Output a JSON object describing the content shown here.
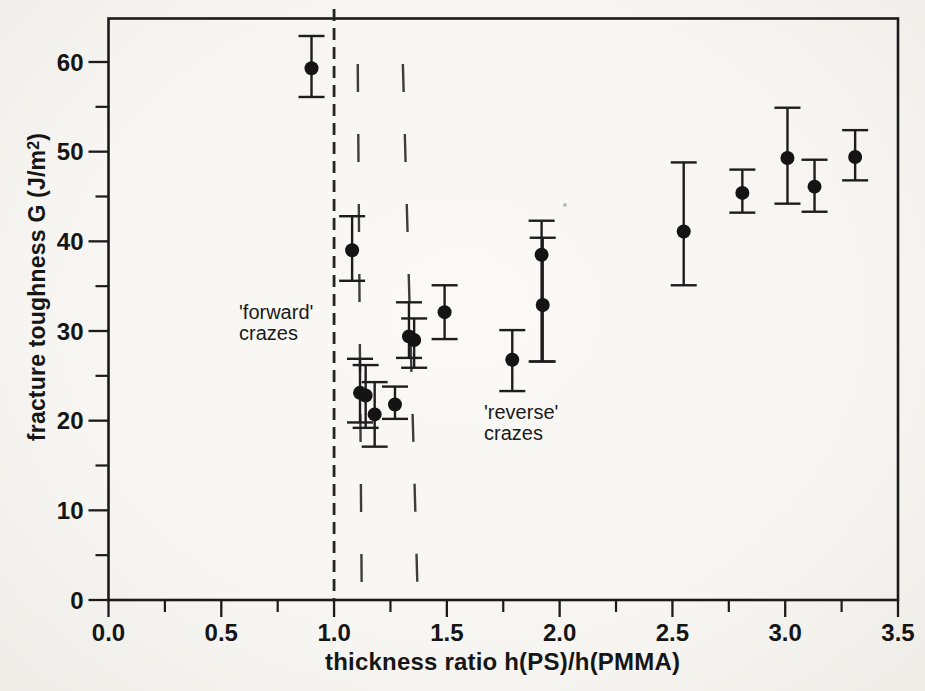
{
  "figure": {
    "background": "#f6f5f1",
    "ink": "#1b1b1b",
    "marker_color": "#141414"
  },
  "chart_data": {
    "type": "scatter",
    "title": "",
    "xlabel": "thickness ratio h(PS)/h(PMMA)",
    "ylabel": "fracture toughness G (J/m2)",
    "ylabel_parts": {
      "main": "fracture toughness G (J/m",
      "sup": "2",
      "close": ")"
    },
    "xlim": [
      0,
      3.5
    ],
    "ylim": [
      0,
      65
    ],
    "grid": false,
    "legend": "none",
    "marker": "filled-circle",
    "x_major_ticks": [
      0,
      0.5,
      1.0,
      1.5,
      2.0,
      2.5,
      3.0,
      3.5
    ],
    "x_tick_labels": [
      "0.0",
      "0.5",
      "1.0",
      "1.5",
      "2.0",
      "2.5",
      "3.0",
      "3.5"
    ],
    "x_minor_ticks": [
      0.25,
      0.75,
      1.25,
      1.75,
      2.25,
      2.75,
      3.25
    ],
    "y_major_ticks": [
      0,
      10,
      20,
      30,
      40,
      50,
      60
    ],
    "y_tick_labels": [
      "0",
      "10",
      "20",
      "30",
      "40",
      "50",
      "60"
    ],
    "y_minor_ticks": [
      5,
      15,
      25,
      35,
      45,
      55
    ],
    "points": [
      {
        "x": 0.9,
        "y": 59.3,
        "lo": 56.1,
        "hi": 62.9
      },
      {
        "x": 1.08,
        "y": 39.0,
        "lo": 35.6,
        "hi": 42.8
      },
      {
        "x": 1.115,
        "y": 23.1,
        "lo": 19.8,
        "hi": 26.9
      },
      {
        "x": 1.14,
        "y": 22.8,
        "lo": 19.2,
        "hi": 26.2
      },
      {
        "x": 1.18,
        "y": 20.7,
        "lo": 17.1,
        "hi": 24.3
      },
      {
        "x": 1.27,
        "y": 21.8,
        "lo": 20.2,
        "hi": 23.8
      },
      {
        "x": 1.332,
        "y": 29.4,
        "lo": 27.0,
        "hi": 33.2
      },
      {
        "x": 1.355,
        "y": 29.0,
        "lo": 25.9,
        "hi": 31.4
      },
      {
        "x": 1.49,
        "y": 32.1,
        "lo": 29.1,
        "hi": 35.1
      },
      {
        "x": 1.79,
        "y": 26.8,
        "lo": 23.3,
        "hi": 30.1
      },
      {
        "x": 1.92,
        "y": 38.5,
        "lo": 26.6,
        "hi": 42.3
      },
      {
        "x": 1.925,
        "y": 32.9,
        "lo": 26.6,
        "hi": 40.4
      },
      {
        "x": 2.55,
        "y": 41.1,
        "lo": 35.1,
        "hi": 48.8
      },
      {
        "x": 2.81,
        "y": 45.4,
        "lo": 43.2,
        "hi": 48.0
      },
      {
        "x": 3.01,
        "y": 49.3,
        "lo": 44.2,
        "hi": 54.9
      },
      {
        "x": 3.13,
        "y": 46.1,
        "lo": 43.3,
        "hi": 49.1
      },
      {
        "x": 3.31,
        "y": 49.4,
        "lo": 46.8,
        "hi": 52.4
      }
    ],
    "boundary_lines": [
      {
        "x_top": 1.0,
        "x_bottom": 1.0,
        "style": "short-dash"
      },
      {
        "x_top": 1.105,
        "x_bottom": 1.123,
        "style": "long-dash"
      },
      {
        "x_top": 1.305,
        "x_bottom": 1.372,
        "style": "long-dash"
      }
    ],
    "annotations": [
      {
        "text": "'forward'\ncrazes",
        "x": 0.58,
        "y": 33.0
      },
      {
        "text": "'reverse'\ncrazes",
        "x": 1.67,
        "y": 22.0
      }
    ]
  }
}
